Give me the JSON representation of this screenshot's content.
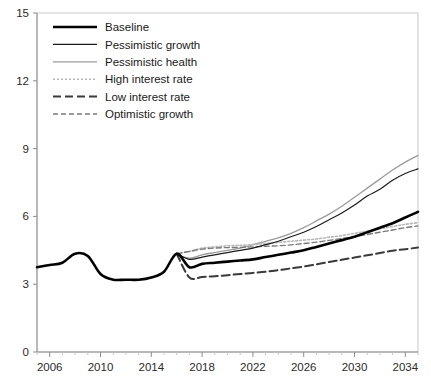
{
  "chart_data": {
    "type": "line",
    "title": "",
    "subtitle": "",
    "xlabel": "",
    "ylabel": "",
    "xlim": [
      2005,
      2035
    ],
    "ylim": [
      0,
      15
    ],
    "xticks": [
      2006,
      2010,
      2014,
      2018,
      2022,
      2026,
      2030,
      2034
    ],
    "xtick_labels": [
      "2006",
      "2010",
      "2014",
      "2018",
      "2022",
      "2026",
      "2030",
      "2034"
    ],
    "yticks": [
      0,
      3,
      6,
      9,
      12,
      15
    ],
    "ytick_labels": [
      "0",
      "3",
      "6",
      "9",
      "12",
      "15"
    ],
    "grid": false,
    "legend_position": "top-left",
    "x": [
      2005,
      2006,
      2007,
      2008,
      2009,
      2010,
      2011,
      2012,
      2013,
      2014,
      2015,
      2016,
      2017,
      2018,
      2019,
      2020,
      2021,
      2022,
      2023,
      2024,
      2025,
      2026,
      2027,
      2028,
      2029,
      2030,
      2031,
      2032,
      2033,
      2034,
      2035
    ],
    "series": [
      {
        "name": "Baseline",
        "color": "#000000",
        "width": 2.6,
        "dash": "none",
        "values": [
          3.75,
          3.85,
          3.95,
          4.35,
          4.25,
          3.45,
          3.2,
          3.2,
          3.2,
          3.3,
          3.55,
          4.35,
          3.75,
          3.9,
          3.95,
          4.0,
          4.05,
          4.1,
          4.2,
          4.3,
          4.4,
          4.5,
          4.65,
          4.8,
          4.95,
          5.1,
          5.3,
          5.5,
          5.7,
          5.95,
          6.2
        ]
      },
      {
        "name": "Pessimistic growth",
        "color": "#1c1c1c",
        "width": 1.2,
        "dash": "none",
        "values": [
          null,
          null,
          null,
          null,
          null,
          null,
          null,
          null,
          null,
          null,
          null,
          4.35,
          4.1,
          4.2,
          4.3,
          4.4,
          4.5,
          4.6,
          4.75,
          4.9,
          5.1,
          5.3,
          5.55,
          5.85,
          6.15,
          6.5,
          6.9,
          7.2,
          7.6,
          7.9,
          8.1
        ]
      },
      {
        "name": "Pessimistic health",
        "color": "#9b9b9b",
        "width": 1.3,
        "dash": "none",
        "values": [
          null,
          null,
          null,
          null,
          null,
          null,
          null,
          null,
          null,
          null,
          null,
          4.35,
          4.15,
          4.3,
          4.4,
          4.5,
          4.6,
          4.75,
          4.9,
          5.05,
          5.25,
          5.5,
          5.8,
          6.1,
          6.45,
          6.85,
          7.25,
          7.65,
          8.05,
          8.4,
          8.7
        ]
      },
      {
        "name": "High interest rate",
        "color": "#b8b8b8",
        "width": 1.6,
        "dash": "2,2",
        "values": [
          null,
          null,
          null,
          null,
          null,
          null,
          null,
          null,
          null,
          null,
          null,
          4.35,
          4.45,
          4.6,
          4.65,
          4.7,
          4.72,
          4.75,
          4.8,
          4.85,
          4.9,
          4.95,
          5.0,
          5.08,
          5.15,
          5.25,
          5.35,
          5.45,
          5.55,
          5.65,
          5.72
        ]
      },
      {
        "name": "Low interest rate",
        "color": "#3a3a3a",
        "width": 2.0,
        "dash": "8,4",
        "values": [
          null,
          null,
          null,
          null,
          null,
          null,
          null,
          null,
          null,
          null,
          null,
          4.35,
          3.3,
          3.32,
          3.35,
          3.4,
          3.45,
          3.5,
          3.55,
          3.62,
          3.7,
          3.78,
          3.88,
          3.98,
          4.08,
          4.18,
          4.28,
          4.38,
          4.48,
          4.55,
          4.62
        ]
      },
      {
        "name": "Optimistic growth",
        "color": "#7a7a7a",
        "width": 1.4,
        "dash": "5,3",
        "values": [
          null,
          null,
          null,
          null,
          null,
          null,
          null,
          null,
          null,
          null,
          null,
          4.35,
          4.45,
          4.55,
          4.6,
          4.62,
          4.63,
          4.65,
          4.68,
          4.7,
          4.74,
          4.8,
          4.86,
          4.94,
          5.02,
          5.1,
          5.2,
          5.3,
          5.4,
          5.5,
          5.58
        ]
      }
    ]
  },
  "legend": {
    "items": [
      {
        "label": "Baseline"
      },
      {
        "label": "Pessimistic growth"
      },
      {
        "label": "Pessimistic health"
      },
      {
        "label": "High interest rate"
      },
      {
        "label": "Low interest rate"
      },
      {
        "label": "Optimistic growth"
      }
    ]
  }
}
